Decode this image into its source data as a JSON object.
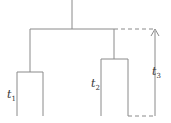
{
  "diagram": {
    "type": "tree-timing",
    "labels": {
      "t1": {
        "base": "t",
        "sub": "1"
      },
      "t2": {
        "base": "t",
        "sub": "2"
      },
      "t3": {
        "base": "t",
        "sub": "3"
      }
    },
    "colors": {
      "line": "#8a8a8a",
      "text": "#333333"
    }
  }
}
